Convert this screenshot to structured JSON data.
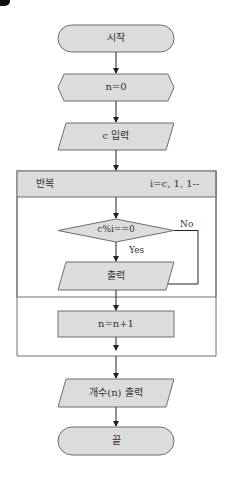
{
  "flowchart": {
    "start": "시작",
    "init": "n=0",
    "input": "c 입력",
    "loop": {
      "label": "반복",
      "range": "i=c, 1, 1--"
    },
    "condition": "c%i==0",
    "yes_label": "Yes",
    "no_label": "No",
    "output": "출력",
    "increment": "n=n+1",
    "final_output": "개수(n) 출력",
    "end": "끝"
  },
  "colors": {
    "shape_fill": "#dcdcdc",
    "stroke": "#6e6e6e",
    "text": "#333333",
    "arrow": "#222222"
  }
}
